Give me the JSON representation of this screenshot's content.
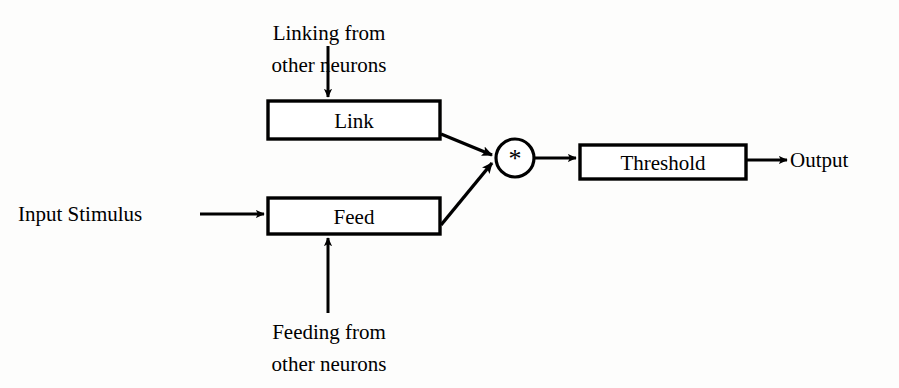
{
  "diagram": {
    "background_color": "#fdfdfc",
    "line_color": "#000000",
    "text_color": "#000000",
    "nodes": {
      "link_box": {
        "label": "Link"
      },
      "feed_box": {
        "label": "Feed"
      },
      "multiplier": {
        "label": "*"
      },
      "threshold_box": {
        "label": "Threshold"
      }
    },
    "labels": {
      "linking_source_line1": "Linking from",
      "linking_source_line2": "other neurons",
      "feeding_source_line1": "Feeding from",
      "feeding_source_line2": "other neurons",
      "input_stimulus": "Input Stimulus",
      "output": "Output"
    }
  }
}
